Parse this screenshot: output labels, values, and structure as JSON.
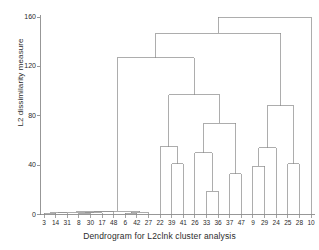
{
  "chart_data": {
    "type": "dendrogram",
    "title": "",
    "xlabel": "Dendrogram for L2clnk cluster analysis",
    "ylabel": "L2 dissimilarity measure",
    "ylim": [
      0,
      165
    ],
    "yticks": [
      0,
      40,
      80,
      120,
      160
    ],
    "ytick_labels": [
      "0",
      "40",
      "80",
      "120",
      "160"
    ],
    "grid": false,
    "legend": null,
    "leaf_labels": [
      "3",
      "14",
      "31",
      "8",
      "30",
      "17",
      "48",
      "6",
      "42",
      "27",
      "22",
      "39",
      "41",
      "26",
      "33",
      "36",
      "37",
      "47",
      "9",
      "29",
      "24",
      "25",
      "28",
      "10"
    ],
    "leaf_count": 24,
    "line_color": "#8a8a8a",
    "axis_color": "#7d7d7d",
    "text_color": "#2b2b2b",
    "merges": [
      {
        "id": "m1",
        "left": "3",
        "right": "14",
        "height": 1.0
      },
      {
        "id": "m2",
        "left": "m1",
        "right": "31",
        "height": 1.5
      },
      {
        "id": "m3",
        "left": "8",
        "right": "30",
        "height": 1.0
      },
      {
        "id": "m4",
        "left": "m3",
        "right": "17",
        "height": 1.5
      },
      {
        "id": "m5",
        "left": "m2",
        "right": "m4",
        "height": 2.0
      },
      {
        "id": "m6",
        "left": "m5",
        "right": "48",
        "height": 2.3
      },
      {
        "id": "m7",
        "left": "6",
        "right": "42",
        "height": 1.2
      },
      {
        "id": "m8",
        "left": "m7",
        "right": "27",
        "height": 1.8
      },
      {
        "id": "m9",
        "left": "m6",
        "right": "m8",
        "height": 2.6
      },
      {
        "id": "m10",
        "left": "39",
        "right": "41",
        "height": 41.0
      },
      {
        "id": "m11",
        "left": "22",
        "right": "m10",
        "height": 55.0
      },
      {
        "id": "m12",
        "left": "33",
        "right": "36",
        "height": 19.0
      },
      {
        "id": "m13",
        "left": "26",
        "right": "m12",
        "height": 50.0
      },
      {
        "id": "m14",
        "left": "37",
        "right": "47",
        "height": 33.0
      },
      {
        "id": "m15",
        "left": "m13",
        "right": "m14",
        "height": 74.0
      },
      {
        "id": "m16",
        "left": "m11",
        "right": "m15",
        "height": 97.0
      },
      {
        "id": "m17",
        "left": "9",
        "right": "29",
        "height": 39.0
      },
      {
        "id": "m18",
        "left": "m17",
        "right": "24",
        "height": 54.0
      },
      {
        "id": "m19",
        "left": "25",
        "right": "28",
        "height": 41.0
      },
      {
        "id": "m20",
        "left": "m18",
        "right": "m19",
        "height": 88.0
      },
      {
        "id": "m21",
        "left": "m9",
        "right": "m16",
        "height": 127.0
      },
      {
        "id": "m22",
        "left": "m21",
        "right": "m20",
        "height": 147.0
      },
      {
        "id": "m23",
        "left": "m22",
        "right": "10",
        "height": 160.0
      }
    ]
  },
  "axis": {
    "y_axis_name": "y-axis",
    "x_axis_name": "x-axis"
  }
}
